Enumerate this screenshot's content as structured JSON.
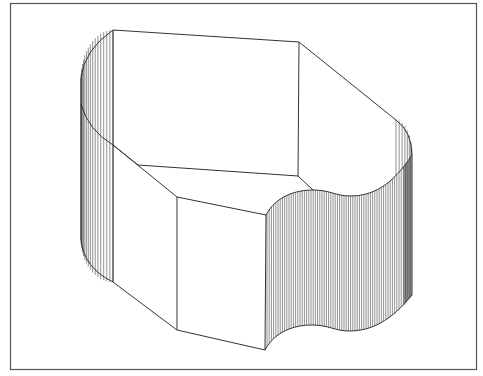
{
  "figure": {
    "kind": "isometric wireframe solid with hatched curved surfaces",
    "frame": {
      "x1": 10,
      "y1": 3,
      "x2": 477,
      "y2": 370,
      "stroke": "#555555"
    },
    "line_color": "#333333",
    "hatch_color": "#444444",
    "background": "#ffffff",
    "vertices": {
      "top_left": [
        113,
        30
      ],
      "top_right": [
        299,
        42
      ],
      "right_shoulder": [
        396,
        120
      ],
      "right_edge_top": [
        412,
        155
      ],
      "right_edge_bottom": [
        412,
        295
      ],
      "left_edge_top": [
        81,
        78
      ],
      "left_edge_bottom": [
        81,
        240
      ],
      "left_col_top_inner": [
        113,
        145
      ],
      "left_col_bottom": [
        113,
        282
      ],
      "inner_back": [
        138,
        165
      ],
      "back_mid": [
        298,
        176
      ],
      "front_top": [
        177,
        197
      ],
      "front_bottom": [
        177,
        330
      ],
      "notch_top": [
        266,
        215
      ],
      "notch_bottom": [
        265,
        350
      ]
    }
  }
}
